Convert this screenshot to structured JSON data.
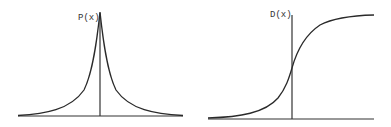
{
  "diagrams": {
    "left": {
      "label": "P(x)",
      "description": "Laplace-like symmetric peaked density curve",
      "curve_color": "#2a2a2a"
    },
    "right": {
      "label": "D(x)",
      "description": "Sigmoid cumulative distribution curve",
      "curve_color": "#2a2a2a"
    }
  }
}
